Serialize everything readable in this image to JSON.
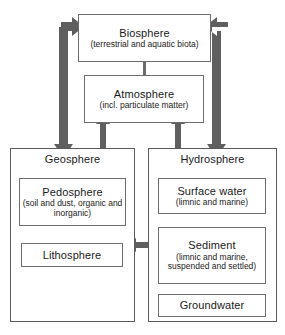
{
  "diagram": {
    "colors": {
      "box_border": "#6d6d6d",
      "outer_border": "#5a5a5a",
      "arrow_thick": "#5f5f5f",
      "arrow_thin": "#6a6a6a",
      "text": "#1a1a1a",
      "background": "#ffffff"
    }
  },
  "nodes": {
    "biosphere": {
      "title": "Biosphere",
      "subtitle": "(terrestrial and aquatic biota)"
    },
    "atmosphere": {
      "title": "Atmosphere",
      "subtitle": "(incl. particulate matter)"
    },
    "geosphere": {
      "title": "Geosphere"
    },
    "hydrosphere": {
      "title": "Hydrosphere"
    },
    "pedosphere": {
      "title": "Pedosphere",
      "subtitle": "(soil and dust, organic and inorganic)"
    },
    "lithosphere": {
      "title": "Lithosphere"
    },
    "surface_water": {
      "title": "Surface water",
      "subtitle": "(limnic and marine)"
    },
    "sediment": {
      "title": "Sediment",
      "subtitle": "(limnic and marine, suspended and settled)"
    },
    "groundwater": {
      "title": "Groundwater"
    }
  },
  "connections": [
    {
      "id": "geosphere-biosphere",
      "from": "Geosphere",
      "to": "Biosphere",
      "style": "thick-elbow-double"
    },
    {
      "id": "hydrosphere-biosphere",
      "from": "Hydrosphere",
      "to": "Biosphere",
      "style": "thick-elbow-double"
    },
    {
      "id": "biosphere-atmosphere",
      "from": "Biosphere",
      "to": "Atmosphere",
      "style": "thin-double-vertical"
    },
    {
      "id": "atmosphere-geosphere",
      "from": "Atmosphere",
      "to": "Geosphere",
      "style": "thick-double-vertical"
    },
    {
      "id": "atmosphere-hydrosphere",
      "from": "Atmosphere",
      "to": "Hydrosphere",
      "style": "thick-double-vertical"
    },
    {
      "id": "geosphere-hydrosphere",
      "from": "Geosphere",
      "to": "Hydrosphere",
      "style": "thick-double-horizontal"
    }
  ]
}
